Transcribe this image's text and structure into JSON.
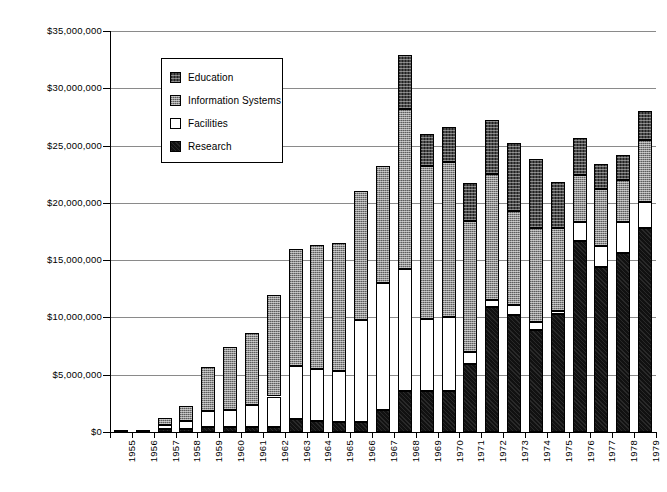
{
  "chart_data": {
    "type": "bar",
    "stacked": true,
    "title": "",
    "xlabel": "",
    "ylabel": "",
    "ylim": [
      0,
      35000000
    ],
    "ytick_values": [
      0,
      5000000,
      10000000,
      15000000,
      20000000,
      25000000,
      30000000,
      35000000
    ],
    "ytick_labels": [
      "$0",
      "$5,000,000",
      "$10,000,000",
      "$15,000,000",
      "$20,000,000",
      "$25,000,000",
      "$30,000,000",
      "$35,000,000"
    ],
    "grid": true,
    "legend_position": "upper-left-inside",
    "categories": [
      "1955",
      "1956",
      "1957",
      "1958",
      "1959",
      "1960",
      "1961",
      "1962",
      "1963",
      "1964",
      "1965",
      "1966",
      "1967",
      "1968",
      "1969",
      "1970",
      "1971",
      "1972",
      "1973",
      "1974",
      "1975",
      "1976",
      "1977",
      "1978",
      "1979"
    ],
    "series": [
      {
        "name": "Research",
        "color": "#111111",
        "pattern": "solid-dark",
        "values": [
          200000,
          200000,
          300000,
          300000,
          400000,
          400000,
          400000,
          400000,
          1100000,
          1000000,
          900000,
          900000,
          1900000,
          3600000,
          3600000,
          3600000,
          5900000,
          10900000,
          10200000,
          8900000,
          10300000,
          16700000,
          14400000,
          15600000,
          17800000
        ]
      },
      {
        "name": "Facilities",
        "color": "#ffffff",
        "pattern": "white",
        "values": [
          0,
          0,
          300000,
          700000,
          1400000,
          1500000,
          2000000,
          2700000,
          4700000,
          4500000,
          4400000,
          8900000,
          11100000,
          10600000,
          6300000,
          6400000,
          1100000,
          600000,
          900000,
          700000,
          300000,
          1600000,
          1800000,
          2700000,
          2300000
        ]
      },
      {
        "name": "Information Systems",
        "color": "#8e8e8e",
        "pattern": "crosshatch-gray",
        "values": [
          0,
          0,
          600000,
          1300000,
          3900000,
          5500000,
          6200000,
          8900000,
          10200000,
          10800000,
          11200000,
          11200000,
          10200000,
          14000000,
          13300000,
          13600000,
          11400000,
          11000000,
          8200000,
          8200000,
          7200000,
          4100000,
          5000000,
          3700000,
          5400000
        ]
      },
      {
        "name": "Education",
        "color": "#4a4a4a",
        "pattern": "crosshatch-dark",
        "values": [
          0,
          0,
          0,
          0,
          0,
          0,
          0,
          0,
          0,
          0,
          0,
          0,
          0,
          4700000,
          2800000,
          3000000,
          3300000,
          4700000,
          5900000,
          6000000,
          4000000,
          3300000,
          2200000,
          2200000,
          2500000
        ]
      }
    ],
    "totals": [
      200000,
      200000,
      1200000,
      2300000,
      5700000,
      7400000,
      8600000,
      12000000,
      16000000,
      16300000,
      16500000,
      21000000,
      23200000,
      32900000,
      26000000,
      26600000,
      21700000,
      27200000,
      25200000,
      23800000,
      21800000,
      25700000,
      23400000,
      24200000,
      28000000
    ]
  },
  "legend": {
    "items": [
      {
        "label": "Education",
        "swatch": "education-swatch"
      },
      {
        "label": "Information  Systems",
        "swatch": "information-systems-swatch"
      },
      {
        "label": "Facilities",
        "swatch": "facilities-swatch"
      },
      {
        "label": "Research",
        "swatch": "research-swatch"
      }
    ]
  }
}
